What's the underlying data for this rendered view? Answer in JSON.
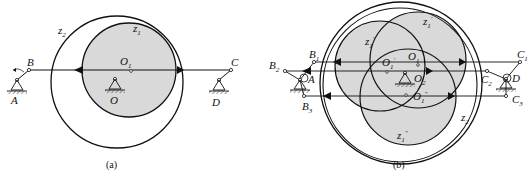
{
  "figure_a": {
    "caption": "(a)",
    "labels": {
      "z2": "z",
      "z2_sub": "2",
      "z1": "z",
      "z1_sub": "1",
      "O1": "O",
      "O1_sub": "1",
      "O": "O",
      "A": "A",
      "B": "B",
      "C": "C",
      "D": "D"
    }
  },
  "figure_b": {
    "caption": "(b)",
    "labels": {
      "B1": "B",
      "B1_sub": "1",
      "B2": "B",
      "B2_sub": "2",
      "B3": "B",
      "B3_sub": "3",
      "A": "A",
      "C1": "C",
      "C1_sub": "1",
      "C2": "C",
      "C2_sub": "2",
      "C3": "C",
      "C3_sub": "3",
      "D": "D",
      "z1p_left": "z",
      "z1p_left_sub": "1",
      "z1p_left_prime": "′",
      "z1p_top": "z",
      "z1p_top_sub": "1",
      "z1p_top_prime": "′",
      "z1pp": "z",
      "z1pp_sub": "1",
      "z1pp_prime": "″",
      "z2": "z",
      "z2_sub": "2",
      "O1": "O",
      "O1_sub": "1",
      "O1p": "O",
      "O1p_sub": "1",
      "O1p_prime": "′",
      "O2": "O",
      "O2_sub": "2",
      "O1pp": "O",
      "O1pp_sub": "1",
      "O1pp_prime": "″"
    }
  },
  "colors": {
    "stroke": "#111111",
    "shade": "#d9d9d9"
  }
}
